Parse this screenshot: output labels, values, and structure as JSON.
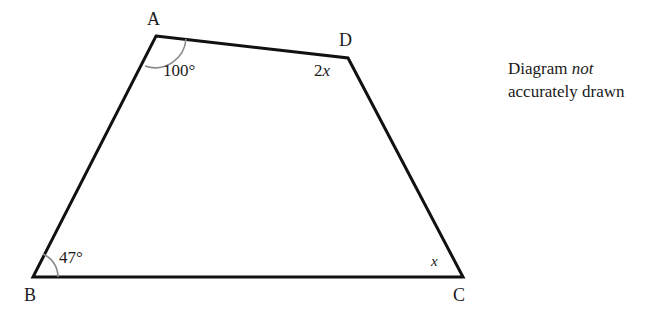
{
  "figure": {
    "type": "geometry-diagram",
    "shape": "quadrilateral",
    "stroke_color": "#111111",
    "arc_color": "#8a8a8a",
    "background_color": "#ffffff",
    "vertices": [
      {
        "name": "A",
        "label": "A",
        "x": 156,
        "y": 36
      },
      {
        "name": "D",
        "label": "D",
        "x": 348,
        "y": 58
      },
      {
        "name": "C",
        "label": "C",
        "x": 463,
        "y": 277
      },
      {
        "name": "B",
        "label": "B",
        "x": 33,
        "y": 277
      }
    ],
    "vertex_labels": {
      "A": "A",
      "B": "B",
      "C": "C",
      "D": "D"
    },
    "angles": [
      {
        "at": "A",
        "text": "100°",
        "value": 100,
        "unit": "degrees",
        "has_arc": true
      },
      {
        "at": "B",
        "text": "47°",
        "value": 47,
        "unit": "degrees",
        "has_arc": true
      },
      {
        "at": "C",
        "text": "x",
        "expression": "x",
        "has_arc": false
      },
      {
        "at": "D",
        "text": "2x",
        "expression": "2x",
        "has_arc": false
      }
    ],
    "angle_label_texts": {
      "A": "100°",
      "B": "47°",
      "C": "x",
      "D_coefficient": "2",
      "D_variable": "x"
    }
  },
  "note": {
    "line1_prefix": "Diagram ",
    "line1_emphasis": "not",
    "line2": "accurately drawn"
  }
}
